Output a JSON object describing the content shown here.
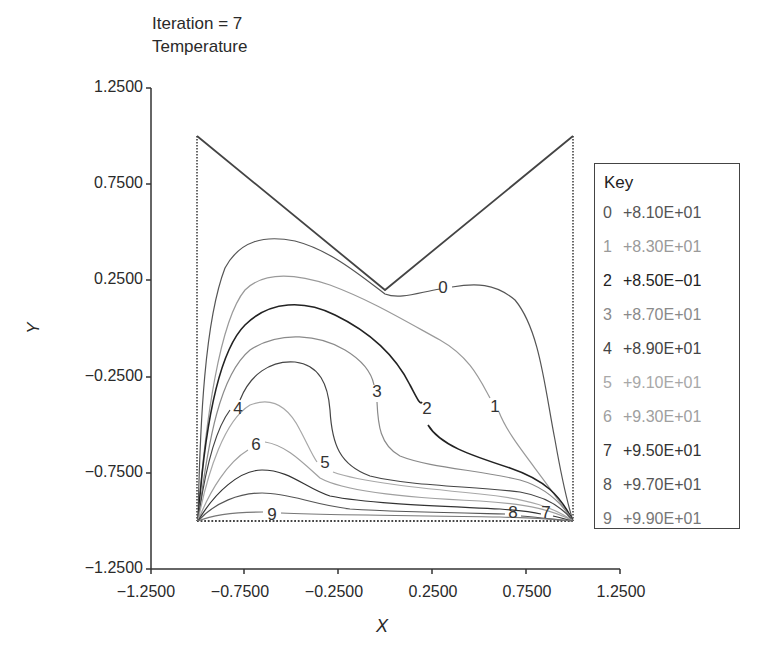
{
  "header": {
    "iteration_label": "Iteration = 7",
    "variable_label": "Temperature"
  },
  "axes": {
    "xlabel": "X",
    "ylabel": "Y",
    "xticks": [
      "−1.2500",
      "−0.7500",
      "−0.2500",
      "0.2500",
      "0.7500",
      "1.2500"
    ],
    "yticks": [
      "1.2500",
      "0.7500",
      "0.2500",
      "−0.2500",
      "−0.7500",
      "−1.2500"
    ]
  },
  "legend": {
    "title": "Key",
    "entries": [
      {
        "index": "0",
        "value": "+8.10E+01",
        "color": "#555555"
      },
      {
        "index": "1",
        "value": "+8.30E+01",
        "color": "#9a9a9a"
      },
      {
        "index": "2",
        "value": "+8.50E−01",
        "color": "#222222"
      },
      {
        "index": "3",
        "value": "+8.70E+01",
        "color": "#8a8a8a"
      },
      {
        "index": "4",
        "value": "+8.90E+01",
        "color": "#444444"
      },
      {
        "index": "5",
        "value": "+9.10E+01",
        "color": "#a8a8a8"
      },
      {
        "index": "6",
        "value": "+9.30E+01",
        "color": "#a0a0a0"
      },
      {
        "index": "7",
        "value": "+9.50E+01",
        "color": "#333333"
      },
      {
        "index": "8",
        "value": "+9.70E+01",
        "color": "#555555"
      },
      {
        "index": "9",
        "value": "+9.90E+01",
        "color": "#777777"
      }
    ]
  },
  "contour_labels": [
    {
      "text": "0",
      "x": 443,
      "y": 293
    },
    {
      "text": "1",
      "x": 495,
      "y": 412
    },
    {
      "text": "2",
      "x": 427,
      "y": 414
    },
    {
      "text": "3",
      "x": 377,
      "y": 397
    },
    {
      "text": "4",
      "x": 238,
      "y": 414
    },
    {
      "text": "5",
      "x": 325,
      "y": 468
    },
    {
      "text": "6",
      "x": 256,
      "y": 450
    },
    {
      "text": "7",
      "x": 546,
      "y": 518
    },
    {
      "text": "8",
      "x": 513,
      "y": 518
    },
    {
      "text": "9",
      "x": 272,
      "y": 520
    }
  ],
  "chart_data": {
    "type": "contour",
    "title": "Iteration = 7",
    "subtitle": "Temperature",
    "xlabel": "X",
    "ylabel": "Y",
    "xlim": [
      -1.25,
      1.25
    ],
    "ylim": [
      -1.25,
      1.25
    ],
    "xticks": [
      -1.25,
      -0.75,
      -0.25,
      0.25,
      0.75,
      1.25
    ],
    "yticks": [
      1.25,
      0.75,
      0.25,
      -0.25,
      -0.75,
      -1.25
    ],
    "grid": false,
    "legend_position": "right",
    "domain_boundary": [
      [
        -1.0,
        -1.0
      ],
      [
        1.0,
        -1.0
      ],
      [
        1.0,
        1.0
      ],
      [
        0.0,
        0.2
      ],
      [
        -1.0,
        1.0
      ],
      [
        -1.0,
        -1.0
      ]
    ],
    "levels": [
      {
        "index": 0,
        "label": "+8.10E+01",
        "value": 81
      },
      {
        "index": 1,
        "label": "+8.30E+01",
        "value": 83
      },
      {
        "index": 2,
        "label": "+8.50E-01",
        "value": 85
      },
      {
        "index": 3,
        "label": "+8.70E+01",
        "value": 87
      },
      {
        "index": 4,
        "label": "+8.90E+01",
        "value": 89
      },
      {
        "index": 5,
        "label": "+9.10E+01",
        "value": 91
      },
      {
        "index": 6,
        "label": "+9.30E+01",
        "value": 93
      },
      {
        "index": 7,
        "label": "+9.50E+01",
        "value": 95
      },
      {
        "index": 8,
        "label": "+9.70E+01",
        "value": 97
      },
      {
        "index": 9,
        "label": "+9.90E+01",
        "value": 99
      }
    ],
    "contour_label_positions": [
      {
        "level": 0,
        "x": 0.3,
        "y": 0.2
      },
      {
        "level": 1,
        "x": 0.6,
        "y": -0.42
      },
      {
        "level": 2,
        "x": 0.22,
        "y": -0.42
      },
      {
        "level": 3,
        "x": -0.04,
        "y": -0.35
      },
      {
        "level": 4,
        "x": -0.78,
        "y": -0.42
      },
      {
        "level": 5,
        "x": -0.32,
        "y": -0.67
      },
      {
        "level": 6,
        "x": -0.68,
        "y": -0.6
      },
      {
        "level": 7,
        "x": 0.86,
        "y": -0.97
      },
      {
        "level": 8,
        "x": 0.68,
        "y": -0.97
      },
      {
        "level": 9,
        "x": -0.6,
        "y": -0.98
      }
    ]
  }
}
